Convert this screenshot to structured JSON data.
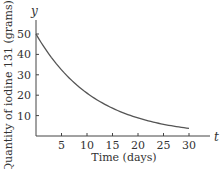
{
  "chart_data": {
    "type": "line",
    "title": "",
    "xlabel": "Time (days)",
    "ylabel": "Quantity of iodine 131 (grams)",
    "x_axis_var": "t",
    "y_axis_var": "y",
    "xlim": [
      0,
      33
    ],
    "ylim": [
      0,
      55
    ],
    "x_ticks": [
      5,
      10,
      15,
      20,
      25,
      30
    ],
    "y_ticks": [
      10,
      20,
      30,
      40,
      50
    ],
    "grid": false,
    "legend": null,
    "series": [
      {
        "name": "Iodine 131 decay",
        "color": "#555555",
        "x": [
          0,
          2,
          4,
          6,
          8,
          10,
          12,
          14,
          16,
          18,
          20,
          22,
          24,
          26,
          28,
          30
        ],
        "values": [
          50,
          42.0,
          35.4,
          29.7,
          25.0,
          21.0,
          17.7,
          14.9,
          12.5,
          10.5,
          8.8,
          7.4,
          6.3,
          5.3,
          4.4,
          3.7
        ]
      }
    ]
  }
}
